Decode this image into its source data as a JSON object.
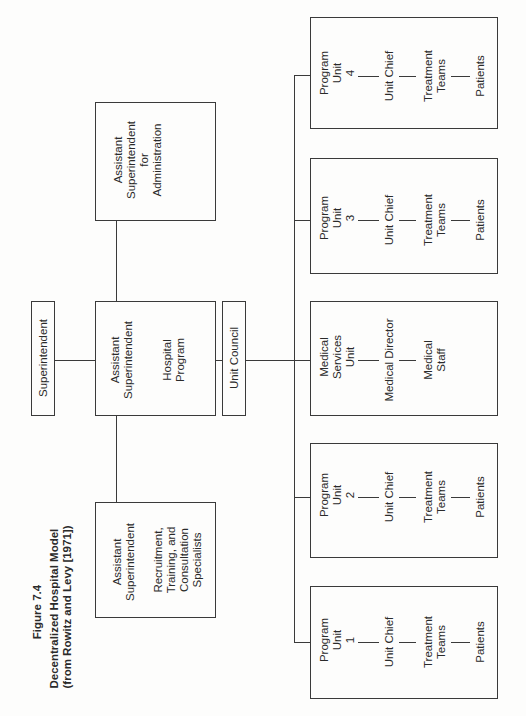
{
  "caption": {
    "figure_label": "Figure 7.4",
    "title_line1": "Decentralized Hospital Model",
    "title_line2": "(from Rowitz and Levy [1971])"
  },
  "nodes": {
    "superintendent": {
      "lines": [
        "Superintendent"
      ]
    },
    "asst_admin": {
      "lines": [
        "Assistant",
        "Superintendent",
        "for",
        "Administration"
      ]
    },
    "asst_program": {
      "title_lines": [
        "Assistant",
        "Superintendent"
      ],
      "sub_lines": [
        "Hospital",
        "Program"
      ]
    },
    "asst_recruitment": {
      "title_lines": [
        "Assistant",
        "Superintendent"
      ],
      "sub_lines": [
        "Recruitment,",
        "Training, and",
        "Consultation",
        "Specialists"
      ]
    },
    "unit_council": {
      "lines": [
        "Unit Council"
      ]
    }
  },
  "units": [
    {
      "name_lines": [
        "Program",
        "Unit",
        "4"
      ],
      "chain": [
        [
          "Unit Chief"
        ],
        [
          "Treatment",
          "Teams"
        ],
        [
          "Patients"
        ]
      ]
    },
    {
      "name_lines": [
        "Program",
        "Unit",
        "3"
      ],
      "chain": [
        [
          "Unit Chief"
        ],
        [
          "Treatment",
          "Teams"
        ],
        [
          "Patients"
        ]
      ]
    },
    {
      "name_lines": [
        "Medical",
        "Services",
        "Unit"
      ],
      "chain": [
        [
          "Medical Director"
        ],
        [
          "Medical",
          "Staff"
        ]
      ]
    },
    {
      "name_lines": [
        "Program",
        "Unit",
        "2"
      ],
      "chain": [
        [
          "Unit Chief"
        ],
        [
          "Treatment",
          "Teams"
        ],
        [
          "Patients"
        ]
      ]
    },
    {
      "name_lines": [
        "Program",
        "Unit",
        "1"
      ],
      "chain": [
        [
          "Unit Chief"
        ],
        [
          "Treatment",
          "Teams"
        ],
        [
          "Patients"
        ]
      ]
    }
  ]
}
